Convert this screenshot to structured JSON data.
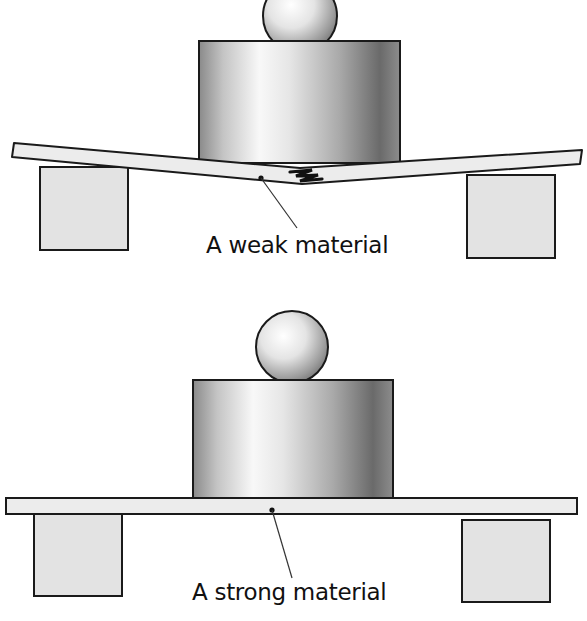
{
  "figure": {
    "title": ""
  },
  "panels": [
    {
      "id": "weak",
      "label": "A weak material",
      "state": "bent-and-cracked",
      "components": [
        "ball",
        "cylinder-weight",
        "beam",
        "left-support-block",
        "right-support-block",
        "crack"
      ]
    },
    {
      "id": "strong",
      "label": "A strong material",
      "state": "straight",
      "components": [
        "ball",
        "cylinder-weight",
        "beam",
        "left-support-block",
        "right-support-block"
      ]
    }
  ],
  "colors": {
    "outline": "#1a1a1a",
    "block_fill": "#e3e3e3",
    "beam_fill": "#ececec",
    "cylinder_dark": "#6e6e6e",
    "cylinder_light": "#f7f7f7",
    "text": "#111111"
  }
}
